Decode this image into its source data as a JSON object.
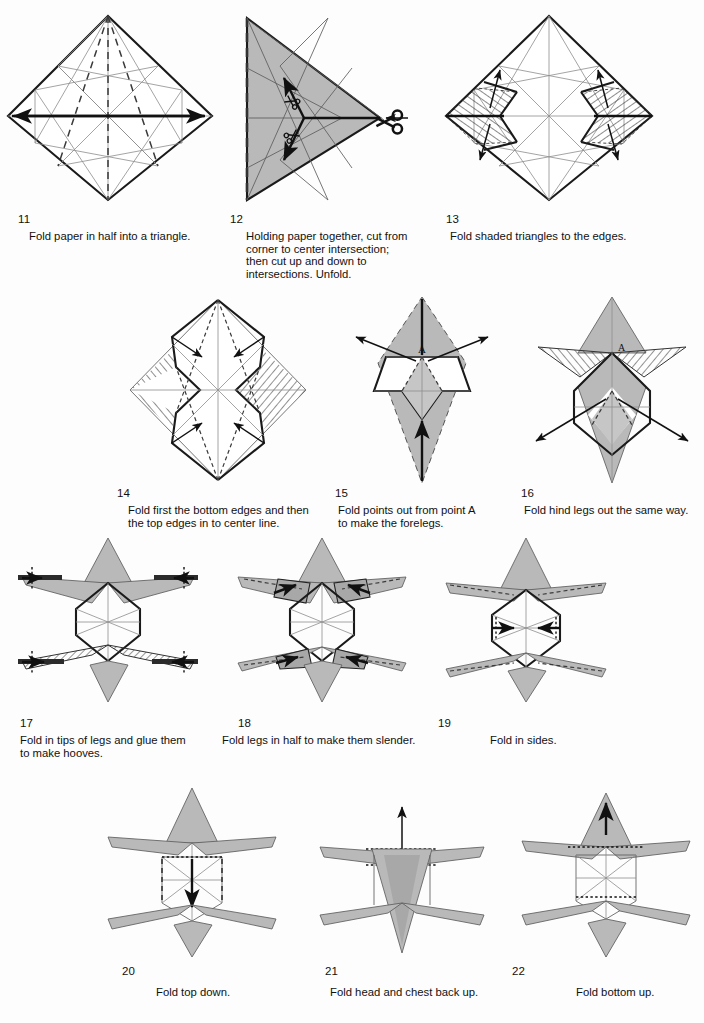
{
  "page": {
    "kind": "origami-instruction-sheet",
    "width": 704,
    "height": 1023,
    "background_color": "#fdfdfd",
    "ink_color": "#141414",
    "shaded_paper_color": "#b9b9b9",
    "total_steps": 12
  },
  "steps": [
    {
      "number": "11",
      "caption": "Fold paper in half into a triangle.",
      "figure_name": "diamond-with-creases-and-horizontal-fold-arrow",
      "has_scissors_icon": false,
      "label_letter": null
    },
    {
      "number": "12",
      "caption": "Holding paper together, cut from\ncorner to center intersection;\nthen cut up and down to\nintersections. Unfold.",
      "figure_name": "folded-triangle-with-cut-lines",
      "has_scissors_icon": true,
      "label_letter": null
    },
    {
      "number": "13",
      "caption": "Fold shaded triangles to the edges.",
      "figure_name": "diamond-with-hatched-triangles",
      "has_scissors_icon": false,
      "label_letter": null
    },
    {
      "number": "14",
      "caption": "Fold first the bottom edges and then\nthe top edges in to center line.",
      "figure_name": "diamond-with-folded-side-flaps",
      "has_scissors_icon": false,
      "label_letter": null
    },
    {
      "number": "15",
      "caption": "Fold points out from point A\nto make the forelegs.",
      "figure_name": "narrow-kite-with-point-a",
      "has_scissors_icon": false,
      "label_letter": "A"
    },
    {
      "number": "16",
      "caption": "Fold hind legs out the same way.",
      "figure_name": "kite-with-forelegs-out",
      "has_scissors_icon": false,
      "label_letter": "A"
    },
    {
      "number": "17",
      "caption": "Fold in tips of legs and glue them\nto make hooves.",
      "figure_name": "four-legged-star-with-hoof-marks",
      "has_scissors_icon": false,
      "label_letter": null
    },
    {
      "number": "18",
      "caption": "Fold legs in half to make them slender.",
      "figure_name": "four-legged-star-legs-halved",
      "has_scissors_icon": false,
      "label_letter": null
    },
    {
      "number": "19",
      "caption": "Fold in sides.",
      "figure_name": "body-with-side-fold-arrows",
      "has_scissors_icon": false,
      "label_letter": null
    },
    {
      "number": "20",
      "caption": "Fold top down.",
      "figure_name": "body-with-top-fold-down-arrow",
      "has_scissors_icon": false,
      "label_letter": null
    },
    {
      "number": "21",
      "caption": "Fold head and chest back up.",
      "figure_name": "body-with-head-up-arrow",
      "has_scissors_icon": false,
      "label_letter": null
    },
    {
      "number": "22",
      "caption": "Fold bottom up.",
      "figure_name": "body-with-bottom-up-arrow",
      "has_scissors_icon": false,
      "label_letter": null
    }
  ]
}
